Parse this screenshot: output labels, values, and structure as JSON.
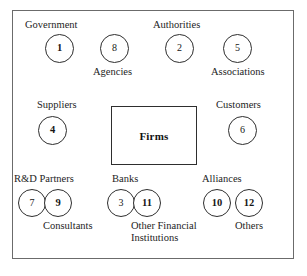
{
  "diagram": {
    "center": {
      "label": "Firms"
    },
    "nodes": [
      {
        "id": "government",
        "number": "1",
        "bold": true,
        "label": "Government"
      },
      {
        "id": "agencies",
        "number": "8",
        "bold": false,
        "label": "Agencies"
      },
      {
        "id": "authorities",
        "number": "2",
        "bold": false,
        "label": "Authorities"
      },
      {
        "id": "associations",
        "number": "5",
        "bold": false,
        "label": "Associations"
      },
      {
        "id": "suppliers",
        "number": "4",
        "bold": true,
        "label": "Suppliers"
      },
      {
        "id": "customers",
        "number": "6",
        "bold": false,
        "label": "Customers"
      },
      {
        "id": "rd-partners",
        "number": "7",
        "bold": false,
        "label": "R&D Partners"
      },
      {
        "id": "consultants",
        "number": "9",
        "bold": true,
        "label": "Consultants"
      },
      {
        "id": "banks",
        "number": "3",
        "bold": false,
        "label": "Banks"
      },
      {
        "id": "other-financial-institutions",
        "number": "11",
        "bold": true,
        "label": "Other Financial Institutions"
      },
      {
        "id": "alliances",
        "number": "10",
        "bold": true,
        "label": "Alliances"
      },
      {
        "id": "others",
        "number": "12",
        "bold": true,
        "label": "Others"
      }
    ]
  },
  "colors": {
    "frame_stroke": "#6b6b6b",
    "node_stroke": "#2e2e2e",
    "text": "#1d1d1d",
    "background": "#ffffff"
  }
}
